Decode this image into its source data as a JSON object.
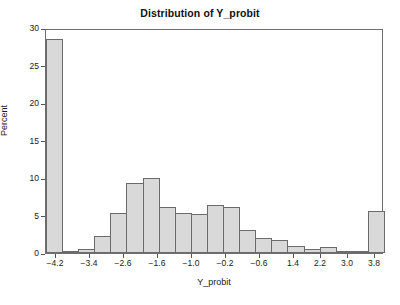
{
  "chart_data": {
    "type": "bar",
    "title": "Distribution of Y_probit",
    "xlabel": "Y_probit",
    "ylabel": "Percent",
    "grid": false,
    "legend": null,
    "ylim": [
      0,
      30
    ],
    "yticks": [
      0,
      5,
      10,
      15,
      20,
      25,
      30
    ],
    "ytick_labels": [
      "0",
      "5",
      "10",
      "15",
      "20",
      "25",
      "30"
    ],
    "xlim": [
      -4.4,
      4.0
    ],
    "xtick_values": [
      -4.2,
      -3.4,
      -2.6,
      -1.6,
      -1.0,
      -0.2,
      -0.6,
      1.4,
      2.2,
      3.0,
      3.8
    ],
    "xtick_labels": [
      "−4.2",
      "−3.4",
      "−2.6",
      "−1.6",
      "−1.0",
      "−0.2",
      "−0.6",
      "1.4",
      "2.2",
      "3.0",
      "3.8"
    ],
    "xtick_positions_px": [
      55,
      89,
      123,
      157,
      191,
      225,
      259,
      293,
      320,
      347,
      374
    ],
    "bin_width": 0.4,
    "bin_centers": [
      -4.2,
      -3.8,
      -3.4,
      -3.0,
      -2.6,
      -2.2,
      -1.8,
      -1.4,
      -1.0,
      -0.6,
      -0.2,
      0.2,
      0.6,
      1.0,
      1.4,
      1.8,
      2.2,
      2.6,
      3.0,
      3.4,
      3.8
    ],
    "categories": [
      "-4.2",
      "-3.8",
      "-3.4",
      "-3.0",
      "-2.6",
      "-2.2",
      "-1.8",
      "-1.4",
      "-1.0",
      "-0.6",
      "-0.2",
      "0.2",
      "0.6",
      "1.0",
      "1.4",
      "1.8",
      "2.2",
      "2.6",
      "3.0",
      "3.4",
      "3.8"
    ],
    "values": [
      28.6,
      0.3,
      0.6,
      2.3,
      5.3,
      9.3,
      10.0,
      6.1,
      5.3,
      5.2,
      6.4,
      6.1,
      3.1,
      2.0,
      1.8,
      0.9,
      0.5,
      0.8,
      0.2,
      0.1,
      5.6
    ],
    "bar_fill_color": "#d9d9d9",
    "bar_edge_color": "#6b6b6b",
    "axis_color": "#6e6e6e",
    "background_color": "#ffffff"
  }
}
